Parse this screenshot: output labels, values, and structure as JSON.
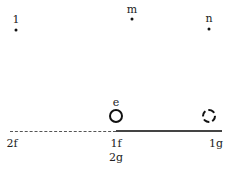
{
  "points": [
    {
      "label": "1",
      "x": 16,
      "y": 30
    },
    {
      "label": "m",
      "x": 132,
      "y": 19
    },
    {
      "label": "n",
      "x": 209,
      "y": 29
    }
  ],
  "objects": [
    {
      "label": "e",
      "style": "solid-circle",
      "x": 116,
      "y": 116
    },
    {
      "label": "",
      "style": "dashed-circle",
      "x": 209,
      "y": 116
    }
  ],
  "axis": {
    "y": 131,
    "dashed_segment": [
      10,
      116
    ],
    "solid_segment": [
      116,
      222
    ],
    "ticks": [
      {
        "label": "2f",
        "x": 12
      },
      {
        "label": "1f",
        "x": 116
      },
      {
        "label": "1g",
        "x": 216
      }
    ],
    "sub_label": {
      "label": "2g",
      "x": 116
    }
  }
}
